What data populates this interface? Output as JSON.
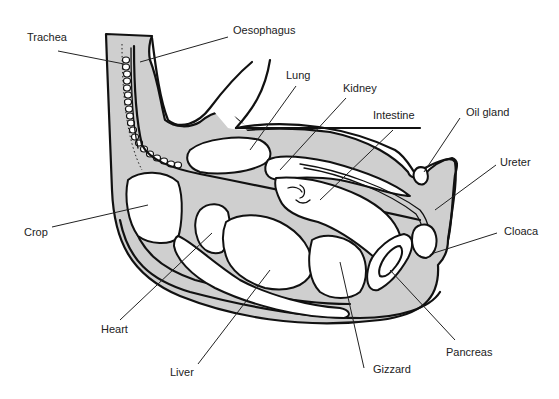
{
  "diagram": {
    "colors": {
      "background": "#ffffff",
      "body_cavity": "#cfcfcf",
      "outline": "#111111",
      "organs": "#ffffff"
    },
    "labels": [
      {
        "id": "trachea",
        "text": "Trachea",
        "x": 27,
        "y": 32
      },
      {
        "id": "oesophagus",
        "text": "Oesophagus",
        "x": 233,
        "y": 25
      },
      {
        "id": "lung",
        "text": "Lung",
        "x": 286,
        "y": 70
      },
      {
        "id": "kidney",
        "text": "Kidney",
        "x": 343,
        "y": 83
      },
      {
        "id": "intestine",
        "text": "Intestine",
        "x": 373,
        "y": 110
      },
      {
        "id": "oil_gland",
        "text": "Oil gland",
        "x": 466,
        "y": 107
      },
      {
        "id": "ureter",
        "text": "Ureter",
        "x": 500,
        "y": 157
      },
      {
        "id": "crop",
        "text": "Crop",
        "x": 24,
        "y": 227
      },
      {
        "id": "cloaca",
        "text": "Cloaca",
        "x": 504,
        "y": 226
      },
      {
        "id": "heart",
        "text": "Heart",
        "x": 101,
        "y": 324
      },
      {
        "id": "pancreas",
        "text": "Pancreas",
        "x": 446,
        "y": 347
      },
      {
        "id": "liver",
        "text": "Liver",
        "x": 170,
        "y": 367
      },
      {
        "id": "gizzard",
        "text": "Gizzard",
        "x": 373,
        "y": 364
      }
    ]
  }
}
